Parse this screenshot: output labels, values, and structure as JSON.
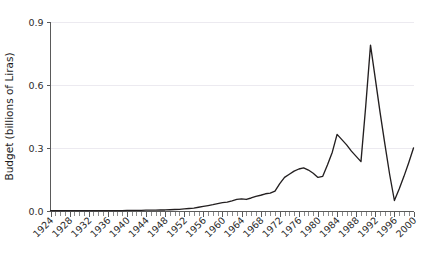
{
  "chart_data": {
    "type": "line",
    "title": "",
    "subtitle": "",
    "xlabel": "",
    "ylabel": "Budget (billions of Liras)",
    "xlim": [
      1924,
      2000
    ],
    "ylim": [
      0.0,
      0.9
    ],
    "grid": true,
    "legend": "none",
    "y_ticks": [
      "0.0",
      "0.3",
      "0.6",
      "0.9"
    ],
    "y_tick_values": [
      0.0,
      0.3,
      0.6,
      0.9
    ],
    "x_ticks": [
      "1924",
      "1928",
      "1932",
      "1936",
      "1940",
      "1944",
      "1948",
      "1952",
      "1956",
      "1960",
      "1964",
      "1968",
      "1972",
      "1976",
      "1980",
      "1984",
      "1988",
      "1992",
      "1996",
      "2000"
    ],
    "x_tick_values": [
      1924,
      1928,
      1932,
      1936,
      1940,
      1944,
      1948,
      1952,
      1956,
      1960,
      1964,
      1968,
      1972,
      1976,
      1980,
      1984,
      1988,
      1992,
      1996,
      2000
    ],
    "minor_tick_interval": 1,
    "line_color": "#231f20",
    "series": [
      {
        "name": "Budget",
        "x": [
          1924,
          1925,
          1926,
          1927,
          1928,
          1929,
          1930,
          1931,
          1932,
          1933,
          1934,
          1935,
          1936,
          1937,
          1938,
          1939,
          1940,
          1941,
          1942,
          1943,
          1944,
          1945,
          1946,
          1947,
          1948,
          1949,
          1950,
          1951,
          1952,
          1953,
          1954,
          1955,
          1956,
          1957,
          1958,
          1959,
          1960,
          1961,
          1962,
          1963,
          1964,
          1965,
          1966,
          1967,
          1968,
          1969,
          1970,
          1971,
          1972,
          1973,
          1974,
          1975,
          1976,
          1977,
          1978,
          1979,
          1980,
          1981,
          1982,
          1983,
          1984,
          1985,
          1986,
          1987,
          1988,
          1989,
          1990,
          1991,
          1992,
          1993,
          1994,
          1995,
          1996,
          1997,
          1998,
          1999,
          2000
        ],
        "y": [
          0.002,
          0.002,
          0.002,
          0.002,
          0.002,
          0.002,
          0.002,
          0.002,
          0.002,
          0.002,
          0.002,
          0.002,
          0.002,
          0.002,
          0.002,
          0.002,
          0.003,
          0.003,
          0.003,
          0.003,
          0.004,
          0.004,
          0.004,
          0.005,
          0.005,
          0.006,
          0.007,
          0.008,
          0.01,
          0.012,
          0.014,
          0.018,
          0.022,
          0.026,
          0.03,
          0.035,
          0.04,
          0.042,
          0.048,
          0.055,
          0.058,
          0.055,
          0.062,
          0.07,
          0.075,
          0.082,
          0.085,
          0.095,
          0.13,
          0.16,
          0.175,
          0.19,
          0.2,
          0.205,
          0.195,
          0.18,
          0.16,
          0.165,
          0.22,
          0.28,
          0.365,
          0.34,
          0.315,
          0.285,
          0.26,
          0.235,
          0.5,
          0.79,
          0.63,
          0.47,
          0.32,
          0.175,
          0.05,
          0.105,
          0.165,
          0.23,
          0.3
        ]
      }
    ]
  },
  "axes": {
    "y_title": "Budget (billions of Liras)"
  }
}
